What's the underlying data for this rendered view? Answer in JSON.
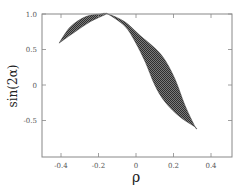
{
  "chart_data": {
    "type": "area",
    "title": "",
    "xlabel": "ρ",
    "ylabel": "sin(2α)",
    "xlim": [
      -0.5,
      0.51
    ],
    "ylim": [
      -1.0,
      1.0
    ],
    "xticks": [
      -0.4,
      -0.2,
      0,
      0.2,
      0.4
    ],
    "xtick_labels": [
      "-0.4",
      "-0.2",
      "0",
      "0.2",
      "0.4"
    ],
    "yticks": [
      1.0,
      0.5,
      0,
      -0.5
    ],
    "ytick_labels": [
      "1.0",
      "0.5",
      "0",
      "-0.5"
    ],
    "grid": false,
    "legend": null,
    "fill_color": "#555555",
    "fill_pattern": "hatched",
    "series": [
      {
        "name": "upper-boundary",
        "x": [
          -0.41,
          -0.35,
          -0.27,
          -0.19,
          -0.15,
          -0.06,
          0.02,
          0.1,
          0.155,
          0.21,
          0.26,
          0.315
        ],
        "values": [
          0.59,
          0.82,
          0.96,
          1.0,
          1.0,
          0.89,
          0.7,
          0.52,
          0.35,
          0.07,
          -0.28,
          -0.59
        ]
      },
      {
        "name": "lower-boundary",
        "x": [
          -0.41,
          -0.325,
          -0.245,
          -0.165,
          -0.15,
          -0.06,
          -0.005,
          0.05,
          0.1,
          0.155,
          0.235,
          0.315
        ],
        "values": [
          0.59,
          0.75,
          0.89,
          0.99,
          1.0,
          0.83,
          0.61,
          0.32,
          0.0,
          -0.24,
          -0.45,
          -0.59
        ]
      }
    ]
  },
  "axes": {
    "xlabel": "ρ",
    "ylabel": "sin(2α)"
  }
}
